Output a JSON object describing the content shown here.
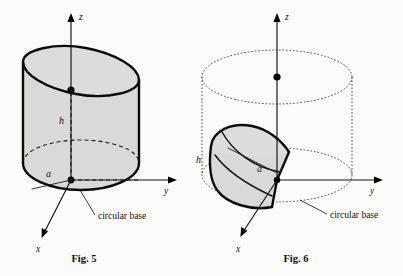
{
  "page": {
    "background_color": "#fbfbfa",
    "ink_color": "#111111",
    "shade_color": "#d9d9d9"
  },
  "figures": [
    {
      "id": "fig-5",
      "caption": "Fig. 5",
      "description": "Cylinder of radius a cut by a slanted plane through the diameter, forming a solid of height h",
      "axes": [
        {
          "name": "z-axis",
          "label": "z"
        },
        {
          "name": "y-axis",
          "label": "y"
        },
        {
          "name": "x-axis",
          "label": "x"
        }
      ],
      "labels": [
        {
          "name": "height-label",
          "text": "h"
        },
        {
          "name": "radius-label",
          "text": "a"
        }
      ],
      "annotations": [
        {
          "name": "circular-base-callout",
          "text": "circular base"
        }
      ]
    },
    {
      "id": "fig-6",
      "caption": "Fig. 6",
      "description": "Wedge-shaped solid inscribed in a dotted cylinder of radius a and height h",
      "axes": [
        {
          "name": "z-axis",
          "label": "z"
        },
        {
          "name": "y-axis",
          "label": "y"
        },
        {
          "name": "x-axis",
          "label": "x"
        }
      ],
      "labels": [
        {
          "name": "height-label",
          "text": "h"
        },
        {
          "name": "radius-label",
          "text": "a"
        }
      ],
      "annotations": [
        {
          "name": "circular-base-callout",
          "text": "circular base"
        }
      ]
    }
  ]
}
